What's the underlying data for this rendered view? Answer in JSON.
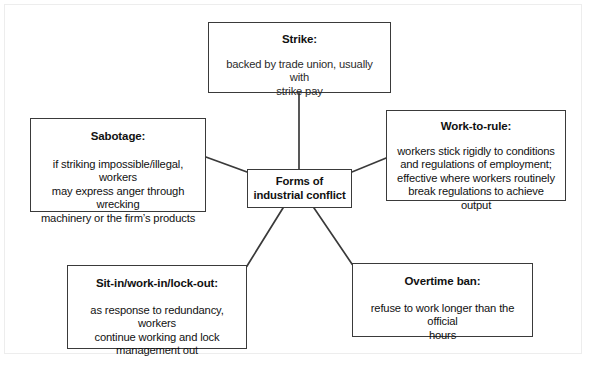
{
  "diagram": {
    "type": "spider-mind-map",
    "center": {
      "id": "center",
      "title": "Forms of\nindustrial conflict"
    },
    "nodes": [
      {
        "id": "strike",
        "title": "Strike:",
        "body": "backed by trade union, usually with\nstrike pay"
      },
      {
        "id": "sabotage",
        "title": "Sabotage:",
        "body": "if striking impossible/illegal, workers\nmay express anger through wrecking\nmachinery or the firm’s products"
      },
      {
        "id": "work-to-rule",
        "title": "Work-to-rule:",
        "body": "workers stick rigidly to conditions\nand regulations of employment;\neffective where workers routinely\nbreak regulations to achieve output"
      },
      {
        "id": "sit-in",
        "title": "Sit-in/work-in/lock-out:",
        "body": "as response to redundancy, workers\ncontinue working and lock\nmanagement out"
      },
      {
        "id": "overtime-ban",
        "title": "Overtime ban:",
        "body": "refuse to work longer than the official\nhours"
      }
    ],
    "connectors": [
      {
        "id": "center-to-strike",
        "from": "center",
        "to": "strike"
      },
      {
        "id": "center-to-sabotage",
        "from": "center",
        "to": "sabotage"
      },
      {
        "id": "center-to-work-to-rule",
        "from": "center",
        "to": "work-to-rule"
      },
      {
        "id": "center-to-sit-in",
        "from": "center",
        "to": "sit-in"
      },
      {
        "id": "center-to-overtime-ban",
        "from": "center",
        "to": "overtime-ban"
      }
    ],
    "colors": {
      "background": "#ffffff",
      "box_border": "#3a3a3a",
      "connector": "#3a3a3a",
      "text": "#111111",
      "outer_frame": "#ededed"
    }
  }
}
